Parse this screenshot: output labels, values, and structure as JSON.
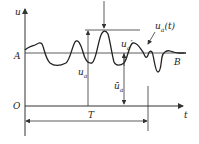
{
  "diagram": {
    "axes": {
      "y_label": "u",
      "x_label": "t",
      "origin_label": "O"
    },
    "levels": {
      "mean_line_label": "A",
      "end_label": "B"
    },
    "annotations": {
      "signal": "u",
      "signal_sub": "a",
      "signal_arg": "(t)",
      "amplitude": "u",
      "amplitude_sub": "a",
      "mean": "ū",
      "mean_sub": "a",
      "fluct": "u",
      "fluct_sub": "a",
      "fluct_sup": "′",
      "period": "T"
    },
    "colors": {
      "line": "#333333",
      "background": "#ffffff"
    }
  }
}
